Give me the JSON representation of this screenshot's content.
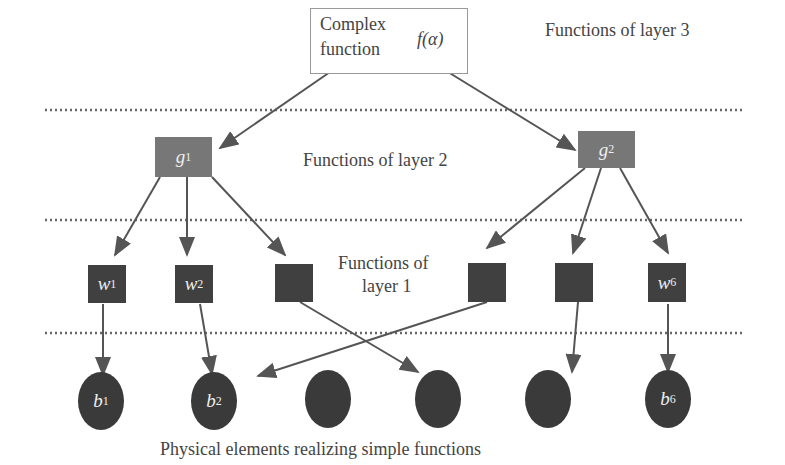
{
  "top": {
    "line1": "Complex",
    "line2": "function",
    "symbol": "f(α)"
  },
  "layers": {
    "layer3": "Functions of layer 3",
    "layer2": "Functions of layer 2",
    "layer1_line1": "Functions of",
    "layer1_line2": "layer 1"
  },
  "g_nodes": [
    {
      "base": "g",
      "sub": "1"
    },
    {
      "base": "g",
      "sub": "2"
    }
  ],
  "w_nodes": [
    {
      "base": "w",
      "sub": "1"
    },
    {
      "base": "w",
      "sub": "2"
    },
    {
      "base": "",
      "sub": ""
    },
    {
      "base": "",
      "sub": ""
    },
    {
      "base": "",
      "sub": ""
    },
    {
      "base": "w",
      "sub": "6"
    }
  ],
  "b_nodes": [
    {
      "base": "b",
      "sub": "1"
    },
    {
      "base": "b",
      "sub": "2"
    },
    {
      "base": "",
      "sub": ""
    },
    {
      "base": "",
      "sub": ""
    },
    {
      "base": "",
      "sub": ""
    },
    {
      "base": "b",
      "sub": "6"
    }
  ],
  "caption": "Physical elements realizing simple functions",
  "colors": {
    "g_fill": "#777777",
    "w_fill": "#404040",
    "b_fill": "#3a3a3a",
    "line": "#555555"
  }
}
